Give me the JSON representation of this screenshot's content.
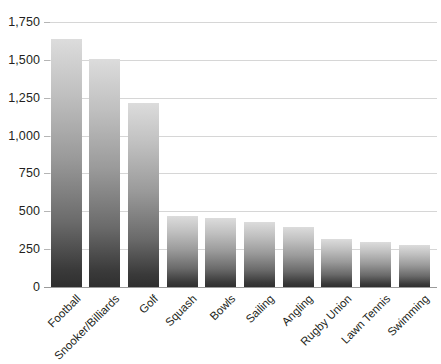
{
  "chart_data": {
    "type": "bar",
    "title": "",
    "subtitle": "",
    "xlabel": "",
    "ylabel": "",
    "categories": [
      "Football",
      "Snooker/Billiards",
      "Golf",
      "Squash",
      "Bowls",
      "Sailing",
      "Angling",
      "Rugby Union",
      "Lawn Tennis",
      "Swimming"
    ],
    "values": [
      1640,
      1505,
      1215,
      470,
      455,
      430,
      395,
      320,
      295,
      280
    ],
    "ylim": [
      0,
      1750
    ],
    "ytick_values": [
      0,
      250,
      500,
      750,
      1000,
      1250,
      1500,
      1750
    ],
    "ytick_labels": [
      "0",
      "250",
      "500",
      "750",
      "1,000",
      "1,250",
      "1,500",
      "1,750"
    ],
    "grid": true,
    "legend": false,
    "legend_position": "none",
    "bar_gradient_top": "#dcdcdc",
    "bar_gradient_bottom": "#2f2f2f",
    "gridline_color": "#d6d6d6",
    "axis_color": "#9a9a9a",
    "text_color": "#231f20",
    "background_color": "#ffffff",
    "xtick_rotation": -45
  }
}
